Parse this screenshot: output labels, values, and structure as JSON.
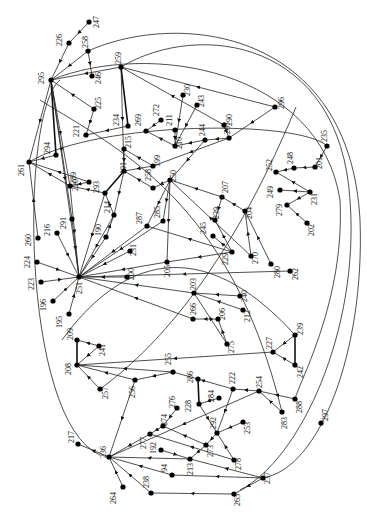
{
  "diagram": {
    "type": "directed-graph",
    "label_rotation_deg": -90,
    "node_color": "#000000",
    "edge_color": "#222222",
    "nodes": [
      {
        "id": "247",
        "x": 89,
        "y": 22,
        "lx": 99,
        "ly": 22
      },
      {
        "id": "226",
        "x": 69,
        "y": 43,
        "lx": 62,
        "ly": 40
      },
      {
        "id": "258",
        "x": 88,
        "y": 51,
        "lx": 88,
        "ly": 42
      },
      {
        "id": "246",
        "x": 92,
        "y": 76,
        "lx": 101,
        "ly": 78
      },
      {
        "id": "259",
        "x": 121,
        "y": 67,
        "lx": 121,
        "ly": 58
      },
      {
        "id": "295",
        "x": 51,
        "y": 80,
        "lx": 44,
        "ly": 78
      },
      {
        "id": "225",
        "x": 94,
        "y": 109,
        "lx": 101,
        "ly": 103
      },
      {
        "id": "221",
        "x": 86,
        "y": 135,
        "lx": 79,
        "ly": 131
      },
      {
        "id": "234",
        "x": 128,
        "y": 126,
        "lx": 119,
        "ly": 120
      },
      {
        "id": "230",
        "x": 183,
        "y": 95,
        "lx": 190,
        "ly": 90
      },
      {
        "id": "243",
        "x": 197,
        "y": 105,
        "lx": 204,
        "ly": 101
      },
      {
        "id": "272",
        "x": 161,
        "y": 120,
        "lx": 159,
        "ly": 110
      },
      {
        "id": "211",
        "x": 175,
        "y": 130,
        "lx": 172,
        "ly": 120
      },
      {
        "id": "269",
        "x": 146,
        "y": 131,
        "lx": 141,
        "ly": 120
      },
      {
        "id": "210",
        "x": 175,
        "y": 146,
        "lx": 182,
        "ly": 143
      },
      {
        "id": "244",
        "x": 205,
        "y": 140,
        "lx": 205,
        "ly": 130
      },
      {
        "id": "267",
        "x": 229,
        "y": 138,
        "lx": 230,
        "ly": 128
      },
      {
        "id": "290",
        "x": 224,
        "y": 125,
        "lx": 232,
        "ly": 120
      },
      {
        "id": "296",
        "x": 275,
        "y": 107,
        "lx": 284,
        "ly": 103
      },
      {
        "id": "215",
        "x": 124,
        "y": 149,
        "lx": 131,
        "ly": 142
      },
      {
        "id": "199",
        "x": 153,
        "y": 166,
        "lx": 160,
        "ly": 161
      },
      {
        "id": "261",
        "x": 29,
        "y": 162,
        "lx": 24,
        "ly": 170
      },
      {
        "id": "294",
        "x": 56,
        "y": 155,
        "lx": 50,
        "ly": 148
      },
      {
        "id": "289",
        "x": 70,
        "y": 186,
        "lx": 76,
        "ly": 178
      },
      {
        "id": "220",
        "x": 89,
        "y": 182,
        "lx": 78,
        "ly": 185
      },
      {
        "id": "293",
        "x": 105,
        "y": 193,
        "lx": 99,
        "ly": 187
      },
      {
        "id": "191",
        "x": 124,
        "y": 171,
        "lx": 126,
        "ly": 168
      },
      {
        "id": "258b",
        "x": 153,
        "y": 188,
        "lx": 151,
        "ly": 175
      },
      {
        "id": "250",
        "x": 170,
        "y": 180,
        "lx": 176,
        "ly": 176
      },
      {
        "id": "235",
        "x": 327,
        "y": 146,
        "lx": 327,
        "ly": 136
      },
      {
        "id": "201",
        "x": 315,
        "y": 167,
        "lx": 322,
        "ly": 163
      },
      {
        "id": "248",
        "x": 294,
        "y": 168,
        "lx": 293,
        "ly": 158
      },
      {
        "id": "252",
        "x": 276,
        "y": 172,
        "lx": 272,
        "ly": 165
      },
      {
        "id": "249",
        "x": 280,
        "y": 190,
        "lx": 273,
        "ly": 192
      },
      {
        "id": "231",
        "x": 310,
        "y": 192,
        "lx": 317,
        "ly": 199
      },
      {
        "id": "279",
        "x": 287,
        "y": 205,
        "lx": 282,
        "ly": 210
      },
      {
        "id": "202",
        "x": 307,
        "y": 223,
        "lx": 314,
        "ly": 230
      },
      {
        "id": "207",
        "x": 222,
        "y": 197,
        "lx": 228,
        "ly": 187
      },
      {
        "id": "204",
        "x": 245,
        "y": 211,
        "lx": 252,
        "ly": 213
      },
      {
        "id": "239",
        "x": 215,
        "y": 220,
        "lx": 219,
        "ly": 213
      },
      {
        "id": "245",
        "x": 213,
        "y": 236,
        "lx": 206,
        "ly": 228
      },
      {
        "id": "287",
        "x": 147,
        "y": 226,
        "lx": 142,
        "ly": 218
      },
      {
        "id": "285",
        "x": 163,
        "y": 221,
        "lx": 160,
        "ly": 212
      },
      {
        "id": "214",
        "x": 114,
        "y": 215,
        "lx": 110,
        "ly": 207
      },
      {
        "id": "190",
        "x": 106,
        "y": 237,
        "lx": 101,
        "ly": 230
      },
      {
        "id": "291",
        "x": 72,
        "y": 219,
        "lx": 66,
        "ly": 223
      },
      {
        "id": "216",
        "x": 57,
        "y": 233,
        "lx": 50,
        "ly": 230
      },
      {
        "id": "260",
        "x": 38,
        "y": 238,
        "lx": 31,
        "ly": 240
      },
      {
        "id": "231b",
        "x": 130,
        "y": 251,
        "lx": 136,
        "ly": 250
      },
      {
        "id": "200",
        "x": 127,
        "y": 277,
        "lx": 134,
        "ly": 274
      },
      {
        "id": "224",
        "x": 37,
        "y": 262,
        "lx": 30,
        "ly": 262
      },
      {
        "id": "223",
        "x": 41,
        "y": 282,
        "lx": 34,
        "ly": 284
      },
      {
        "id": "251",
        "x": 79,
        "y": 277,
        "lx": 82,
        "ly": 288
      },
      {
        "id": "196",
        "x": 53,
        "y": 301,
        "lx": 46,
        "ly": 305
      },
      {
        "id": "195",
        "x": 69,
        "y": 314,
        "lx": 62,
        "ly": 322
      },
      {
        "id": "229",
        "x": 232,
        "y": 252,
        "lx": 228,
        "ly": 259
      },
      {
        "id": "270",
        "x": 251,
        "y": 256,
        "lx": 258,
        "ly": 258
      },
      {
        "id": "280",
        "x": 271,
        "y": 264,
        "lx": 280,
        "ly": 272
      },
      {
        "id": "262",
        "x": 290,
        "y": 271,
        "lx": 298,
        "ly": 274
      },
      {
        "id": "205",
        "x": 167,
        "y": 262,
        "lx": 170,
        "ly": 271
      },
      {
        "id": "203",
        "x": 194,
        "y": 293,
        "lx": 196,
        "ly": 284
      },
      {
        "id": "240",
        "x": 240,
        "y": 296,
        "lx": 247,
        "ly": 296
      },
      {
        "id": "212",
        "x": 243,
        "y": 310,
        "lx": 250,
        "ly": 316
      },
      {
        "id": "266",
        "x": 193,
        "y": 319,
        "lx": 196,
        "ly": 309
      },
      {
        "id": "206",
        "x": 218,
        "y": 319,
        "lx": 225,
        "ly": 314
      },
      {
        "id": "275",
        "x": 227,
        "y": 344,
        "lx": 234,
        "ly": 347
      },
      {
        "id": "209",
        "x": 77,
        "y": 340,
        "lx": 73,
        "ly": 334
      },
      {
        "id": "241",
        "x": 99,
        "y": 346,
        "lx": 105,
        "ly": 350
      },
      {
        "id": "208",
        "x": 77,
        "y": 365,
        "lx": 71,
        "ly": 369
      },
      {
        "id": "257",
        "x": 100,
        "y": 389,
        "lx": 108,
        "ly": 393
      },
      {
        "id": "256",
        "x": 135,
        "y": 380,
        "lx": 135,
        "ly": 392
      },
      {
        "id": "255",
        "x": 173,
        "y": 372,
        "lx": 171,
        "ly": 359
      },
      {
        "id": "239b",
        "x": 295,
        "y": 335,
        "lx": 303,
        "ly": 329
      },
      {
        "id": "227",
        "x": 273,
        "y": 352,
        "lx": 272,
        "ly": 343
      },
      {
        "id": "242",
        "x": 295,
        "y": 365,
        "lx": 303,
        "ly": 372
      },
      {
        "id": "222",
        "x": 233,
        "y": 389,
        "lx": 235,
        "ly": 378
      },
      {
        "id": "254",
        "x": 259,
        "y": 391,
        "lx": 262,
        "ly": 382
      },
      {
        "id": "286",
        "x": 198,
        "y": 379,
        "lx": 193,
        "ly": 377
      },
      {
        "id": "284",
        "x": 219,
        "y": 398,
        "lx": 214,
        "ly": 396
      },
      {
        "id": "228",
        "x": 199,
        "y": 404,
        "lx": 191,
        "ly": 406
      },
      {
        "id": "288",
        "x": 295,
        "y": 399,
        "lx": 302,
        "ly": 407
      },
      {
        "id": "297",
        "x": 321,
        "y": 423,
        "lx": 328,
        "ly": 415
      },
      {
        "id": "283",
        "x": 282,
        "y": 412,
        "lx": 287,
        "ly": 423
      },
      {
        "id": "292",
        "x": 217,
        "y": 433,
        "lx": 216,
        "ly": 423
      },
      {
        "id": "253",
        "x": 243,
        "y": 422,
        "lx": 250,
        "ly": 428
      },
      {
        "id": "276",
        "x": 177,
        "y": 408,
        "lx": 175,
        "ly": 402
      },
      {
        "id": "274",
        "x": 163,
        "y": 426,
        "lx": 167,
        "ly": 420
      },
      {
        "id": "277",
        "x": 150,
        "y": 434,
        "lx": 146,
        "ly": 443
      },
      {
        "id": "273",
        "x": 206,
        "y": 445,
        "lx": 213,
        "ly": 451
      },
      {
        "id": "278",
        "x": 234,
        "y": 460,
        "lx": 241,
        "ly": 464
      },
      {
        "id": "192",
        "x": 161,
        "y": 450,
        "lx": 156,
        "ly": 448
      },
      {
        "id": "213",
        "x": 190,
        "y": 459,
        "lx": 193,
        "ly": 469
      },
      {
        "id": "217",
        "x": 78,
        "y": 444,
        "lx": 74,
        "ly": 437
      },
      {
        "id": "236",
        "x": 109,
        "y": 457,
        "lx": 106,
        "ly": 452
      },
      {
        "id": "94",
        "x": 172,
        "y": 475,
        "lx": 167,
        "ly": 468
      },
      {
        "id": "238",
        "x": 151,
        "y": 493,
        "lx": 149,
        "ly": 482
      },
      {
        "id": "264",
        "x": 123,
        "y": 487,
        "lx": 116,
        "ly": 498
      },
      {
        "id": "237",
        "x": 263,
        "y": 478,
        "lx": 270,
        "ly": 478
      },
      {
        "id": "265",
        "x": 234,
        "y": 494,
        "lx": 240,
        "ly": 500
      }
    ],
    "edges": [
      [
        "247",
        "226"
      ],
      [
        "226",
        "295"
      ],
      [
        "258",
        "295"
      ],
      [
        "258",
        "246"
      ],
      [
        "225",
        "295"
      ],
      [
        "225",
        "221"
      ],
      [
        "230",
        "210"
      ],
      [
        "243",
        "210"
      ],
      [
        "272",
        "269"
      ],
      [
        "211",
        "210"
      ],
      [
        "210",
        "269"
      ],
      [
        "244",
        "210"
      ],
      [
        "267",
        "244"
      ],
      [
        "296",
        "267"
      ],
      [
        "290",
        "267"
      ],
      [
        "244",
        "250"
      ],
      [
        "267",
        "199"
      ],
      [
        "199",
        "215"
      ],
      [
        "199",
        "191"
      ],
      [
        "215",
        "191"
      ],
      [
        "234",
        "221"
      ],
      [
        "259",
        "295"
      ],
      [
        "259",
        "234"
      ],
      [
        "259",
        "191"
      ],
      [
        "296",
        "259"
      ],
      [
        "290",
        "259"
      ],
      [
        "295",
        "261"
      ],
      [
        "295",
        "294"
      ],
      [
        "295",
        "289"
      ],
      [
        "295",
        "291"
      ],
      [
        "289",
        "261"
      ],
      [
        "294",
        "261"
      ],
      [
        "220",
        "261"
      ],
      [
        "220",
        "289"
      ],
      [
        "293",
        "289"
      ],
      [
        "214",
        "293"
      ],
      [
        "191",
        "293"
      ],
      [
        "191",
        "214"
      ],
      [
        "190",
        "214"
      ],
      [
        "258b",
        "191"
      ],
      [
        "250",
        "258b"
      ],
      [
        "250",
        "287"
      ],
      [
        "250",
        "285"
      ],
      [
        "250",
        "205"
      ],
      [
        "235",
        "201"
      ],
      [
        "201",
        "248"
      ],
      [
        "248",
        "252"
      ],
      [
        "231",
        "252"
      ],
      [
        "231",
        "249"
      ],
      [
        "231",
        "279"
      ],
      [
        "202",
        "279"
      ],
      [
        "207",
        "239"
      ],
      [
        "207",
        "250"
      ],
      [
        "204",
        "207"
      ],
      [
        "229",
        "245"
      ],
      [
        "229",
        "239"
      ],
      [
        "229",
        "287"
      ],
      [
        "229",
        "205"
      ],
      [
        "270",
        "204"
      ],
      [
        "280",
        "204"
      ],
      [
        "270",
        "250"
      ],
      [
        "262",
        "251"
      ],
      [
        "291",
        "251"
      ],
      [
        "216",
        "251"
      ],
      [
        "260",
        "261"
      ],
      [
        "224",
        "251"
      ],
      [
        "223",
        "251"
      ],
      [
        "196",
        "251"
      ],
      [
        "195",
        "251"
      ],
      [
        "190",
        "251"
      ],
      [
        "231b",
        "251"
      ],
      [
        "200",
        "251"
      ],
      [
        "205",
        "251"
      ],
      [
        "287",
        "251"
      ],
      [
        "285",
        "251"
      ],
      [
        "289",
        "251"
      ],
      [
        "214",
        "251"
      ],
      [
        "293",
        "251"
      ],
      [
        "295",
        "251"
      ],
      [
        "203",
        "251"
      ],
      [
        "240",
        "203"
      ],
      [
        "212",
        "203"
      ],
      [
        "206",
        "266"
      ],
      [
        "275",
        "206"
      ],
      [
        "275",
        "203"
      ],
      [
        "266",
        "251"
      ],
      [
        "241",
        "209"
      ],
      [
        "208",
        "209"
      ],
      [
        "241",
        "208"
      ],
      [
        "257",
        "208"
      ],
      [
        "256",
        "208"
      ],
      [
        "255",
        "208"
      ],
      [
        "227",
        "208"
      ],
      [
        "239b",
        "227"
      ],
      [
        "242",
        "227"
      ],
      [
        "239b",
        "242"
      ],
      [
        "255",
        "256"
      ],
      [
        "222",
        "255"
      ],
      [
        "254",
        "222"
      ],
      [
        "286",
        "228"
      ],
      [
        "284",
        "228"
      ],
      [
        "228",
        "292"
      ],
      [
        "253",
        "292"
      ],
      [
        "283",
        "254"
      ],
      [
        "288",
        "254"
      ],
      [
        "222",
        "292"
      ],
      [
        "292",
        "273"
      ],
      [
        "278",
        "292"
      ],
      [
        "273",
        "274"
      ],
      [
        "273",
        "213"
      ],
      [
        "274",
        "277"
      ],
      [
        "276",
        "274"
      ],
      [
        "192",
        "213"
      ],
      [
        "213",
        "236"
      ],
      [
        "237",
        "213"
      ],
      [
        "237",
        "94"
      ],
      [
        "237",
        "265"
      ],
      [
        "265",
        "238"
      ],
      [
        "238",
        "236"
      ],
      [
        "94",
        "236"
      ],
      [
        "236",
        "217"
      ],
      [
        "264",
        "236"
      ],
      [
        "277",
        "236"
      ],
      [
        "278",
        "277"
      ],
      [
        "256",
        "236"
      ],
      [
        "254",
        "236"
      ]
    ],
    "thick_edges": [
      [
        "295",
        "294"
      ],
      [
        "259",
        "234"
      ],
      [
        "208",
        "209"
      ],
      [
        "286",
        "228"
      ],
      [
        "239b",
        "242"
      ],
      [
        "191",
        "293"
      ]
    ],
    "arcs": [
      {
        "d": "M60,80 C20,110 20,420 100,455"
      },
      {
        "d": "M121,67 C200,20 340,40 350,200 C360,330 300,460 240,490"
      },
      {
        "d": "M88,51 C180,10 350,30 360,220 C365,350 320,470 262,478"
      },
      {
        "d": "M51,80 C150,40 320,70 340,200 C345,300 300,380 295,399"
      },
      {
        "d": "M29,162 C100,120 300,120 327,146"
      },
      {
        "d": "M40,100 C120,150 230,200 282,412"
      },
      {
        "d": "M100,389 C140,360 220,290 296,107"
      },
      {
        "d": "M62,340 C120,260 200,230 295,335"
      }
    ],
    "labels_visible": [
      "247",
      "226",
      "258",
      "246",
      "259",
      "295",
      "225",
      "221",
      "234",
      "230",
      "243",
      "272",
      "211",
      "269",
      "210",
      "244",
      "267",
      "290",
      "296",
      "215",
      "199",
      "261",
      "294",
      "289",
      "220",
      "293",
      "191",
      "258",
      "250",
      "235",
      "201",
      "248",
      "252",
      "249",
      "231",
      "279",
      "202",
      "207",
      "204",
      "239",
      "245",
      "287",
      "285",
      "214",
      "190",
      "291",
      "216",
      "260",
      "231",
      "200",
      "224",
      "223",
      "251",
      "196",
      "195",
      "229",
      "270",
      "280",
      "262",
      "205",
      "203",
      "240",
      "212",
      "266",
      "206",
      "275",
      "209",
      "241",
      "208",
      "257",
      "256",
      "255",
      "239",
      "227",
      "242",
      "222",
      "254",
      "286",
      "284",
      "228",
      "288",
      "297",
      "283",
      "292",
      "253",
      "276",
      "274",
      "277",
      "273",
      "278",
      "192",
      "213",
      "217",
      "236",
      "94",
      "238",
      "264",
      "237",
      "265"
    ]
  }
}
